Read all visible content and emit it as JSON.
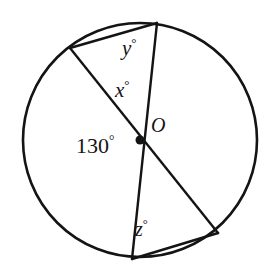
{
  "figure": {
    "type": "circle-geometry-diagram",
    "background_color": "#ffffff",
    "stroke_color": "#141414",
    "labels": {
      "angle_y": "y",
      "angle_x": "x",
      "angle_z": "z",
      "angle_130": "130",
      "center_point": "O",
      "degree_symbol": "°"
    },
    "label_texts": {
      "y_full": "y°",
      "x_full": "x°",
      "z_full": "z°",
      "central_angle_full": "130°",
      "center_full": "O"
    },
    "geometry": {
      "circle": {
        "cx": 140,
        "cy": 140,
        "r": 117
      },
      "center_dot": {
        "cx": 140,
        "cy": 140,
        "r": 4.5
      },
      "points": {
        "top": {
          "x": 157,
          "y": 23
        },
        "bottom": {
          "x": 132,
          "y": 259
        },
        "upper_left": {
          "x": 70,
          "y": 48
        },
        "lower_right": {
          "x": 218,
          "y": 233
        },
        "center": {
          "x": 140,
          "y": 140
        }
      },
      "segments": [
        {
          "name": "diameter-vertical",
          "from": "top",
          "to": "bottom"
        },
        {
          "name": "diameter-diagonal",
          "from": "upper_left",
          "to": "lower_right"
        },
        {
          "name": "chord-top",
          "from": "upper_left",
          "to": "top"
        },
        {
          "name": "chord-bottom",
          "from": "bottom",
          "to": "lower_right"
        }
      ]
    }
  }
}
